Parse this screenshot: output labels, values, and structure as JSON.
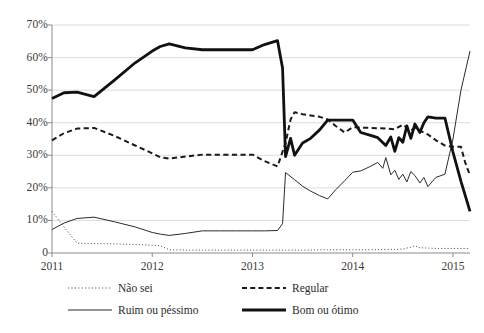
{
  "chart_data": {
    "type": "line",
    "title": "",
    "subtitle": "",
    "xlabel": "",
    "ylabel": "",
    "xlim": [
      2011.0,
      2015.17
    ],
    "ylim": [
      0,
      70
    ],
    "grid": true,
    "grid_axis": "y",
    "legend_position": "bottom",
    "y_ticks": [
      0,
      10,
      20,
      30,
      40,
      50,
      60,
      70
    ],
    "y_tick_labels": [
      "0",
      "10%",
      "20%",
      "30%",
      "40%",
      "50%",
      "60%",
      "70%"
    ],
    "x_ticks": [
      2011,
      2012,
      2013,
      2014,
      2015
    ],
    "x_tick_labels": [
      "2011",
      "2012",
      "2013",
      "2014",
      "2015"
    ],
    "series": [
      {
        "name": "Não sei",
        "style": "dotted",
        "color": "#555555",
        "width": 1.0,
        "points": [
          [
            2011.0,
            12.8
          ],
          [
            2011.12,
            8.0
          ],
          [
            2011.25,
            3.0
          ],
          [
            2011.42,
            2.9
          ],
          [
            2011.62,
            2.8
          ],
          [
            2011.83,
            2.6
          ],
          [
            2012.0,
            2.4
          ],
          [
            2012.08,
            2.2
          ],
          [
            2012.17,
            1.0
          ],
          [
            2012.33,
            0.9
          ],
          [
            2012.5,
            0.9
          ],
          [
            2012.67,
            0.9
          ],
          [
            2012.83,
            0.9
          ],
          [
            2013.0,
            0.9
          ],
          [
            2013.12,
            0.9
          ],
          [
            2013.25,
            0.9
          ],
          [
            2013.33,
            0.9
          ],
          [
            2013.42,
            0.9
          ],
          [
            2013.58,
            0.9
          ],
          [
            2013.75,
            1.0
          ],
          [
            2013.92,
            1.0
          ],
          [
            2014.0,
            1.0
          ],
          [
            2014.17,
            1.0
          ],
          [
            2014.33,
            1.1
          ],
          [
            2014.42,
            1.1
          ],
          [
            2014.5,
            1.2
          ],
          [
            2014.58,
            1.8
          ],
          [
            2014.62,
            2.2
          ],
          [
            2014.67,
            1.6
          ],
          [
            2014.75,
            1.5
          ],
          [
            2014.83,
            1.4
          ],
          [
            2014.92,
            1.4
          ],
          [
            2015.0,
            1.4
          ],
          [
            2015.08,
            1.4
          ],
          [
            2015.17,
            1.4
          ]
        ]
      },
      {
        "name": "Ruim ou péssimo",
        "style": "solid-thin",
        "color": "#2b2b2b",
        "width": 1.0,
        "points": [
          [
            2011.0,
            7.2
          ],
          [
            2011.12,
            9.2
          ],
          [
            2011.25,
            10.6
          ],
          [
            2011.42,
            11.0
          ],
          [
            2011.62,
            9.6
          ],
          [
            2011.83,
            8.0
          ],
          [
            2012.0,
            6.3
          ],
          [
            2012.08,
            5.8
          ],
          [
            2012.17,
            5.4
          ],
          [
            2012.33,
            6.0
          ],
          [
            2012.5,
            6.8
          ],
          [
            2012.67,
            6.8
          ],
          [
            2012.83,
            6.8
          ],
          [
            2013.0,
            6.8
          ],
          [
            2013.12,
            6.8
          ],
          [
            2013.25,
            6.9
          ],
          [
            2013.3,
            9.0
          ],
          [
            2013.33,
            24.7
          ],
          [
            2013.42,
            22.5
          ],
          [
            2013.5,
            20.5
          ],
          [
            2013.58,
            19.0
          ],
          [
            2013.67,
            17.6
          ],
          [
            2013.75,
            16.6
          ],
          [
            2013.83,
            19.4
          ],
          [
            2013.92,
            22.2
          ],
          [
            2014.0,
            24.8
          ],
          [
            2014.08,
            25.2
          ],
          [
            2014.17,
            26.5
          ],
          [
            2014.25,
            27.8
          ],
          [
            2014.3,
            26.0
          ],
          [
            2014.33,
            29.3
          ],
          [
            2014.38,
            24.0
          ],
          [
            2014.42,
            25.4
          ],
          [
            2014.46,
            22.6
          ],
          [
            2014.5,
            24.2
          ],
          [
            2014.54,
            21.8
          ],
          [
            2014.58,
            25.0
          ],
          [
            2014.62,
            23.8
          ],
          [
            2014.67,
            21.5
          ],
          [
            2014.71,
            23.2
          ],
          [
            2014.75,
            20.4
          ],
          [
            2014.83,
            23.2
          ],
          [
            2014.92,
            24.2
          ],
          [
            2015.0,
            35.0
          ],
          [
            2015.08,
            50.0
          ],
          [
            2015.17,
            62.0
          ]
        ]
      },
      {
        "name": "Regular",
        "style": "dashed",
        "color": "#1a1a1a",
        "width": 2.0,
        "points": [
          [
            2011.0,
            34.6
          ],
          [
            2011.12,
            36.8
          ],
          [
            2011.25,
            38.2
          ],
          [
            2011.42,
            38.4
          ],
          [
            2011.62,
            36.0
          ],
          [
            2011.83,
            33.0
          ],
          [
            2012.0,
            30.6
          ],
          [
            2012.08,
            29.4
          ],
          [
            2012.17,
            29.0
          ],
          [
            2012.33,
            29.6
          ],
          [
            2012.5,
            30.2
          ],
          [
            2012.67,
            30.2
          ],
          [
            2012.83,
            30.2
          ],
          [
            2013.0,
            30.2
          ],
          [
            2013.12,
            28.2
          ],
          [
            2013.25,
            26.6
          ],
          [
            2013.33,
            33.8
          ],
          [
            2013.38,
            41.0
          ],
          [
            2013.42,
            43.2
          ],
          [
            2013.5,
            42.6
          ],
          [
            2013.58,
            42.2
          ],
          [
            2013.67,
            41.8
          ],
          [
            2013.75,
            41.0
          ],
          [
            2013.83,
            39.0
          ],
          [
            2013.92,
            37.0
          ],
          [
            2014.0,
            38.6
          ],
          [
            2014.17,
            38.4
          ],
          [
            2014.33,
            38.2
          ],
          [
            2014.42,
            38.0
          ],
          [
            2014.5,
            39.4
          ],
          [
            2014.58,
            37.6
          ],
          [
            2014.62,
            38.4
          ],
          [
            2014.67,
            37.6
          ],
          [
            2014.75,
            36.4
          ],
          [
            2014.83,
            34.6
          ],
          [
            2014.92,
            33.0
          ],
          [
            2015.0,
            32.6
          ],
          [
            2015.08,
            32.6
          ],
          [
            2015.12,
            28.0
          ],
          [
            2015.17,
            23.8
          ]
        ]
      },
      {
        "name": "Bom ou ótimo",
        "style": "solid-thick",
        "color": "#111111",
        "width": 2.8,
        "points": [
          [
            2011.0,
            47.4
          ],
          [
            2011.12,
            49.2
          ],
          [
            2011.25,
            49.4
          ],
          [
            2011.42,
            48.0
          ],
          [
            2011.62,
            53.0
          ],
          [
            2011.83,
            58.4
          ],
          [
            2012.0,
            62.0
          ],
          [
            2012.08,
            63.4
          ],
          [
            2012.17,
            64.2
          ],
          [
            2012.33,
            63.0
          ],
          [
            2012.5,
            62.4
          ],
          [
            2012.67,
            62.4
          ],
          [
            2012.83,
            62.4
          ],
          [
            2013.0,
            62.4
          ],
          [
            2013.12,
            64.0
          ],
          [
            2013.25,
            65.2
          ],
          [
            2013.3,
            56.8
          ],
          [
            2013.33,
            29.6
          ],
          [
            2013.38,
            35.2
          ],
          [
            2013.42,
            30.0
          ],
          [
            2013.5,
            33.8
          ],
          [
            2013.58,
            35.2
          ],
          [
            2013.67,
            37.8
          ],
          [
            2013.75,
            40.8
          ],
          [
            2013.83,
            40.8
          ],
          [
            2013.92,
            40.8
          ],
          [
            2014.0,
            40.8
          ],
          [
            2014.08,
            37.0
          ],
          [
            2014.17,
            36.2
          ],
          [
            2014.25,
            35.4
          ],
          [
            2014.33,
            33.0
          ],
          [
            2014.38,
            35.6
          ],
          [
            2014.42,
            31.2
          ],
          [
            2014.46,
            35.4
          ],
          [
            2014.5,
            34.0
          ],
          [
            2014.54,
            39.0
          ],
          [
            2014.58,
            35.2
          ],
          [
            2014.62,
            39.6
          ],
          [
            2014.67,
            37.0
          ],
          [
            2014.71,
            40.0
          ],
          [
            2014.75,
            41.8
          ],
          [
            2014.83,
            41.4
          ],
          [
            2014.92,
            41.4
          ],
          [
            2015.0,
            31.0
          ],
          [
            2015.08,
            22.0
          ],
          [
            2015.17,
            12.8
          ]
        ]
      }
    ]
  },
  "axes": {
    "y_tick_labels": [
      "70%",
      "60%",
      "50%",
      "40%",
      "30%",
      "20%",
      "10%",
      "0"
    ],
    "x_tick_labels": [
      "2011",
      "2012",
      "2013",
      "2014",
      "2015"
    ]
  },
  "legend": {
    "items": [
      {
        "label": "Não sei",
        "style": "dotted"
      },
      {
        "label": "Regular",
        "style": "dashed"
      },
      {
        "label": "Ruim ou péssimo",
        "style": "solid-thin"
      },
      {
        "label": "Bom ou ótimo",
        "style": "solid-thick"
      }
    ]
  },
  "colors": {
    "background": "#ffffff",
    "gridline": "#dcdcdc",
    "axis": "#8c8c8c",
    "text": "#2b2b2b",
    "series_dark": "#111111",
    "series_mid": "#2b2b2b",
    "series_light": "#555555"
  }
}
